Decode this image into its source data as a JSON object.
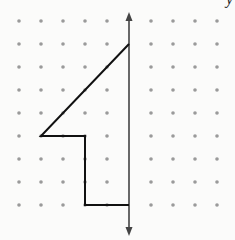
{
  "diagram": {
    "type": "dot-grid with vertical axis and polygon (half-figure for reflection)",
    "axis_label": "y",
    "grid": {
      "columns_x": [
        19,
        41,
        63,
        85,
        107,
        129,
        151,
        173,
        195,
        217
      ],
      "rows_y": [
        21,
        44,
        67,
        90,
        113,
        136,
        159,
        182,
        205
      ],
      "dot_color": "#9a9a9a"
    },
    "axis": {
      "x": 129,
      "y_top": 12,
      "y_bottom": 236,
      "color": "#444444"
    },
    "shape": {
      "points": [
        [
          129,
          44
        ],
        [
          41,
          136
        ],
        [
          85,
          136
        ],
        [
          85,
          205
        ],
        [
          129,
          205
        ]
      ],
      "stroke": "#111111"
    }
  }
}
